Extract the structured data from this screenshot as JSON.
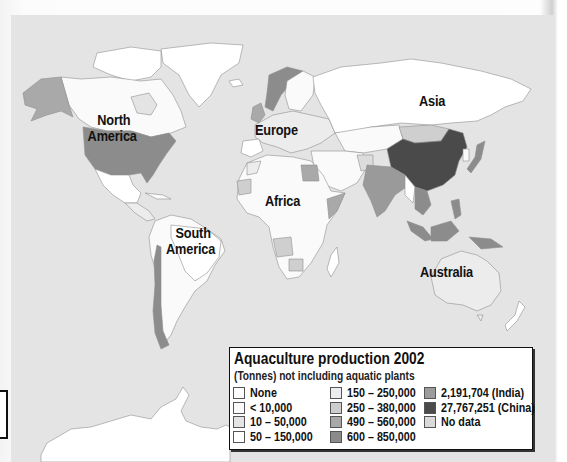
{
  "map": {
    "title": "Aquaculture production 2002",
    "subtitle": "(Tonnes) not including aquatic plants",
    "region_labels": {
      "north_america": "North\nAmerica",
      "north_america_line1": "North",
      "north_america_line2": "America",
      "europe": "Europe",
      "asia": "Asia",
      "africa": "Africa",
      "south_america_line1": "South",
      "south_america_line2": "America",
      "australia": "Australia"
    },
    "colors": {
      "ocean": "#e4e4e4",
      "none": "#ffffff",
      "lt10000": "#fafafa",
      "r10_50000": "#e6e6e6",
      "r50_150000": "#ffffff",
      "r150_250000": "#ececec",
      "r250_380000": "#cfcfcf",
      "r490_560000": "#a9a9a9",
      "r600_850000": "#8c8c8c",
      "india": "#9a9a9a",
      "china": "#4a4a4a",
      "no_data": "#dcdcdc",
      "border": "#9a9a9a"
    }
  },
  "legend": {
    "title": "Aquaculture production 2002",
    "subtitle": "(Tonnes) not including aquatic plants",
    "columns": [
      [
        {
          "label": "None",
          "color": "#ffffff"
        },
        {
          "label": "< 10,000",
          "color": "#fbfbfb"
        },
        {
          "label": "10 – 50,000",
          "color": "#e4e4e4"
        },
        {
          "label": "50 – 150,000",
          "color": "#ffffff"
        }
      ],
      [
        {
          "label": "150 – 250,000",
          "color": "#ededed"
        },
        {
          "label": "250 – 380,000",
          "color": "#cdcdcd"
        },
        {
          "label": "490 – 560,000",
          "color": "#a8a8a8"
        },
        {
          "label": "600 – 850,000",
          "color": "#8a8a8a"
        }
      ],
      [
        {
          "label": "2,191,704 (India)",
          "color": "#9c9c9c"
        },
        {
          "label": "27,767,251 (China)",
          "color": "#4b4b4b"
        },
        {
          "label": "No data",
          "color": "#dadada"
        }
      ]
    ]
  }
}
